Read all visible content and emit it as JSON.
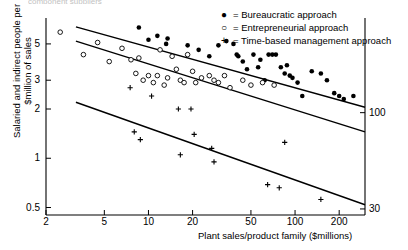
{
  "top_cut_text": "component suppliers",
  "chart_data": {
    "type": "scatter",
    "title": "",
    "xlabel": "Plant sales/product family ($millions)",
    "ylabel": "Salaried and indirect people per $million of sales",
    "xscale": "log",
    "yscale": "log",
    "xlim": [
      2,
      300
    ],
    "ylim": [
      0.45,
      7.0
    ],
    "grid": false,
    "legend_position": "top-right",
    "xticks": [
      {
        "value": 2,
        "label": "2"
      },
      {
        "value": 5,
        "label": "5"
      },
      {
        "value": 10,
        "label": "10"
      },
      {
        "value": 20,
        "label": "20"
      },
      {
        "value": 50,
        "label": "50"
      },
      {
        "value": 100,
        "label": "100"
      },
      {
        "value": 200,
        "label": "200"
      }
    ],
    "yticks": [
      {
        "value": 0.5,
        "label": "0.5"
      },
      {
        "value": 1,
        "label": "1"
      },
      {
        "value": 2,
        "label": "2"
      },
      {
        "value": 3,
        "label": "3"
      },
      {
        "value": 5,
        "label": "5"
      }
    ],
    "right_axis_ticks": [
      {
        "value": 1.9,
        "label": "100"
      },
      {
        "value": 0.49,
        "label": "30"
      }
    ],
    "series": [
      {
        "name": "Bureaucratic approach",
        "marker": "filled-circle",
        "legend_label": "= Bureaucratic approach",
        "points": [
          [
            8.6,
            6.3
          ],
          [
            11.5,
            5.6
          ],
          [
            10.0,
            5.3
          ],
          [
            13.5,
            5.4
          ],
          [
            13.2,
            5.0
          ],
          [
            18.5,
            4.9
          ],
          [
            22.0,
            4.6
          ],
          [
            26.0,
            4.2
          ],
          [
            30.0,
            4.9
          ],
          [
            34.0,
            5.2
          ],
          [
            38.0,
            5.0
          ],
          [
            40.0,
            4.3
          ],
          [
            41.0,
            4.2
          ],
          [
            44.0,
            3.9
          ],
          [
            47.0,
            3.5
          ],
          [
            52.0,
            4.3
          ],
          [
            56.0,
            3.6
          ],
          [
            58.0,
            4.0
          ],
          [
            62.0,
            3.0
          ],
          [
            66.0,
            4.3
          ],
          [
            70.0,
            4.3
          ],
          [
            74.0,
            4.3
          ],
          [
            80.0,
            3.6
          ],
          [
            85.0,
            3.3
          ],
          [
            88.0,
            3.7
          ],
          [
            92.0,
            3.2
          ],
          [
            96.0,
            3.1
          ],
          [
            104.0,
            2.9
          ],
          [
            112.0,
            2.4
          ],
          [
            130.0,
            3.4
          ],
          [
            150.0,
            3.3
          ],
          [
            165.0,
            3.0
          ],
          [
            185.0,
            2.5
          ],
          [
            200.0,
            2.4
          ],
          [
            215.0,
            2.3
          ],
          [
            250.0,
            2.4
          ]
        ]
      },
      {
        "name": "Entrepreneurial approach",
        "marker": "open-circle",
        "legend_label": "= Entrepreneurial approach",
        "points": [
          [
            2.5,
            5.9
          ],
          [
            3.6,
            4.3
          ],
          [
            4.5,
            5.1
          ],
          [
            5.4,
            3.9
          ],
          [
            6.6,
            4.7
          ],
          [
            7.6,
            4.0
          ],
          [
            8.2,
            3.3
          ],
          [
            8.6,
            4.1
          ],
          [
            9.2,
            3.0
          ],
          [
            10.0,
            3.2
          ],
          [
            10.8,
            2.9
          ],
          [
            11.5,
            3.2
          ],
          [
            12.0,
            4.6
          ],
          [
            12.8,
            2.8
          ],
          [
            13.5,
            3.1
          ],
          [
            14.5,
            4.2
          ],
          [
            15.5,
            3.5
          ],
          [
            16.5,
            3.0
          ],
          [
            17.5,
            2.9
          ],
          [
            18.5,
            4.3
          ],
          [
            20.0,
            3.4
          ],
          [
            21.0,
            2.9
          ],
          [
            23.0,
            3.1
          ],
          [
            26.0,
            3.2
          ],
          [
            28.0,
            3.0
          ],
          [
            30.0,
            2.9
          ],
          [
            33.0,
            3.2
          ],
          [
            36.0,
            2.7
          ],
          [
            44.0,
            3.0
          ],
          [
            50.0,
            2.8
          ],
          [
            60.0,
            2.9
          ],
          [
            72.0,
            2.8
          ]
        ]
      },
      {
        "name": "Time-based management approach",
        "marker": "plus",
        "legend_label": "= Time-based management approach",
        "points": [
          [
            7.5,
            2.7
          ],
          [
            10.5,
            2.4
          ],
          [
            16.0,
            2.0
          ],
          [
            19.5,
            2.0
          ],
          [
            8.0,
            1.45
          ],
          [
            8.8,
            1.3
          ],
          [
            16.5,
            1.05
          ],
          [
            20.5,
            1.4
          ],
          [
            27.0,
            1.15
          ],
          [
            28.0,
            0.95
          ],
          [
            65.0,
            0.69
          ],
          [
            78.0,
            0.66
          ],
          [
            85.0,
            1.25
          ],
          [
            150.0,
            0.56
          ]
        ]
      }
    ],
    "trend_lines": [
      {
        "name": "bureaucratic-trend",
        "x1": 3.2,
        "y1": 6.35,
        "x2": 300,
        "y2": 2.05
      },
      {
        "name": "entrepreneurial-trend",
        "x1": 3.2,
        "y1": 5.2,
        "x2": 300,
        "y2": 1.45
      },
      {
        "name": "time-based-trend",
        "x1": 3.2,
        "y1": 2.2,
        "x2": 300,
        "y2": 0.52
      }
    ]
  }
}
